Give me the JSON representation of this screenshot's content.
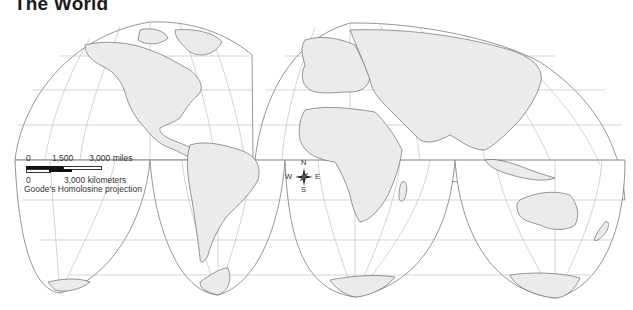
{
  "title": "The World",
  "legend": {
    "miles_ticks": [
      "0",
      "1,500",
      "3,000 miles"
    ],
    "km_ticks": [
      "0",
      "3,000 kilometers"
    ],
    "projection": "Goode's Homolosine projection"
  },
  "compass": {
    "n": "N",
    "s": "S",
    "e": "E",
    "w": "W"
  },
  "colors": {
    "land": "#ebebeb",
    "ocean": "#ffffff",
    "outline": "#555555",
    "graticule": "#a8a8a8",
    "title": "#1a1a1a"
  },
  "regions": [
    "North America",
    "South America",
    "Europe",
    "Asia",
    "Africa",
    "Australia",
    "Antarctica",
    "Greenland"
  ]
}
